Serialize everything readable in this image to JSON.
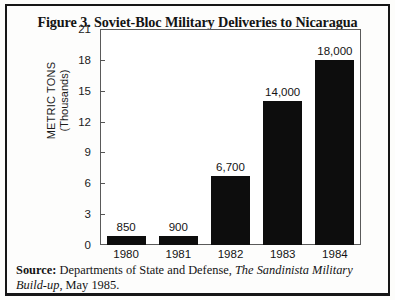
{
  "figure": {
    "title": "Figure 3. Soviet-Bloc Military Deliveries to Nicaragua",
    "source_prefix": "Source:",
    "source_text_1": " Departments of State and Defense, ",
    "source_publication": "The Sandinista Military Build-up",
    "source_text_2": ", May 1985."
  },
  "chart_data": {
    "type": "bar",
    "title": "Figure 3. Soviet-Bloc Military Deliveries to Nicaragua",
    "xlabel": "",
    "ylabel": "METRIC TONS (Thousands)",
    "ylabel_line1": "METRIC TONS",
    "ylabel_line2": "(Thousands)",
    "categories": [
      "1980",
      "1981",
      "1982",
      "1983",
      "1984"
    ],
    "values": [
      0.85,
      0.9,
      6.7,
      14.0,
      18.0
    ],
    "value_labels": [
      "850",
      "900",
      "6,700",
      "14,000",
      "18,000"
    ],
    "ylim": [
      0,
      21
    ],
    "yticks": [
      0,
      3,
      6,
      9,
      12,
      15,
      18,
      21
    ],
    "ytick_labels": [
      "0",
      "3",
      "6",
      "9",
      "12",
      "15",
      "18",
      "21"
    ],
    "grid": false,
    "legend": "none",
    "bar_color": "#0d0d0d",
    "units": "thousands of metric tons"
  }
}
